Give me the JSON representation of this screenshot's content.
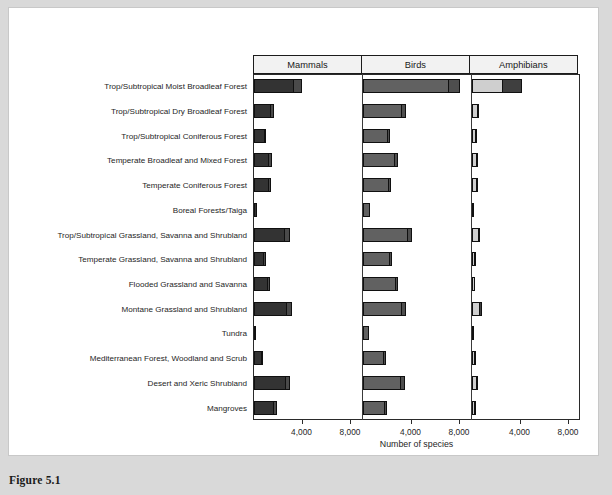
{
  "figure": {
    "caption": "Figure 5.1"
  },
  "chart_data": {
    "type": "bar",
    "title": "",
    "xlabel": "Number of species",
    "ylabel": "",
    "orientation": "horizontal",
    "layout": "small-multiples, three side-by-side panels sharing one category axis",
    "grid": false,
    "legend": "none",
    "xlim": [
      0,
      10500
    ],
    "xticks": [
      4000,
      8000
    ],
    "xticklabels": [
      "4,000",
      "8,000"
    ],
    "panels": [
      "Mammals",
      "Birds",
      "Amphibians"
    ],
    "categories": [
      "Trop/Subtropical Moist Broadleaf Forest",
      "Trop/Subtropical Dry Broadleaf Forest",
      "Trop/Subtropical Coniferous Forest",
      "Temperate Broadleaf and Mixed Forest",
      "Temperate Coniferous Forest",
      "Boreal Forests/Taiga",
      "Trop/Subtropical Grassland, Savanna and Shrubland",
      "Temperate Grassland, Savanna and Shrubland",
      "Flooded Grassland and Savanna",
      "Montane Grassland and Shrubland",
      "Tundra",
      "Mediterranean Forest, Woodland and Scrub",
      "Desert and Xeric Shrubland",
      "Mangroves"
    ],
    "series": [
      {
        "name": "Mammals",
        "panel": 0,
        "color": "#333333",
        "endemic_color": "#4a4a4a",
        "total_values": [
          4000,
          1700,
          1050,
          1500,
          1450,
          300,
          3000,
          1000,
          1350,
          3200,
          200,
          800,
          3050,
          1900
        ],
        "endemic_values": [
          700,
          250,
          150,
          250,
          200,
          40,
          450,
          120,
          180,
          450,
          25,
          110,
          400,
          260
        ]
      },
      {
        "name": "Birds",
        "panel": 1,
        "color": "#616161",
        "endemic_color": "#4e4e4e",
        "total_values": [
          8000,
          3600,
          2250,
          2900,
          2350,
          600,
          4100,
          2450,
          2950,
          3550,
          550,
          1950,
          3500,
          2050
        ],
        "endemic_values": [
          900,
          330,
          180,
          220,
          190,
          55,
          380,
          190,
          230,
          330,
          45,
          160,
          300,
          175
        ]
      },
      {
        "name": "Amphibians",
        "panel": 2,
        "color": "#cfcfcf",
        "endemic_color": "#3f3f3f",
        "total_values": [
          4200,
          620,
          430,
          560,
          520,
          90,
          720,
          330,
          300,
          900,
          60,
          350,
          560,
          380
        ],
        "endemic_values": [
          1700,
          120,
          90,
          110,
          100,
          18,
          140,
          70,
          60,
          190,
          12,
          70,
          110,
          80
        ]
      }
    ]
  }
}
